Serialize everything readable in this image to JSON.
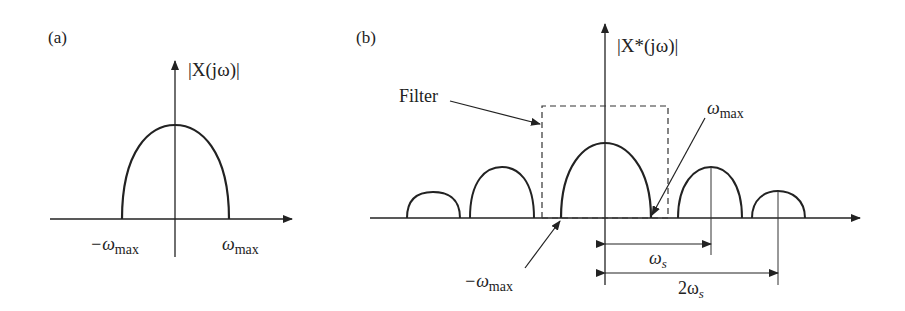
{
  "panel_a": {
    "label": "(a)",
    "y_axis_label": "|X(jω)|",
    "tick_neg": "−ω",
    "tick_neg_sub": "max",
    "tick_pos": "ω",
    "tick_pos_sub": "max"
  },
  "panel_b": {
    "label": "(b)",
    "y_axis_label": "|X*(jω)|",
    "filter_label": "Filter",
    "omega_max_label": "ω",
    "omega_max_sub": "max",
    "neg_omega_max_label": "−ω",
    "neg_omega_max_sub": "max",
    "omega_s_label": "ω",
    "omega_s_sub": "s",
    "two_omega_s_label": "2ω",
    "two_omega_s_sub": "s"
  },
  "colors": {
    "stroke": "#222222",
    "background": "#ffffff"
  }
}
